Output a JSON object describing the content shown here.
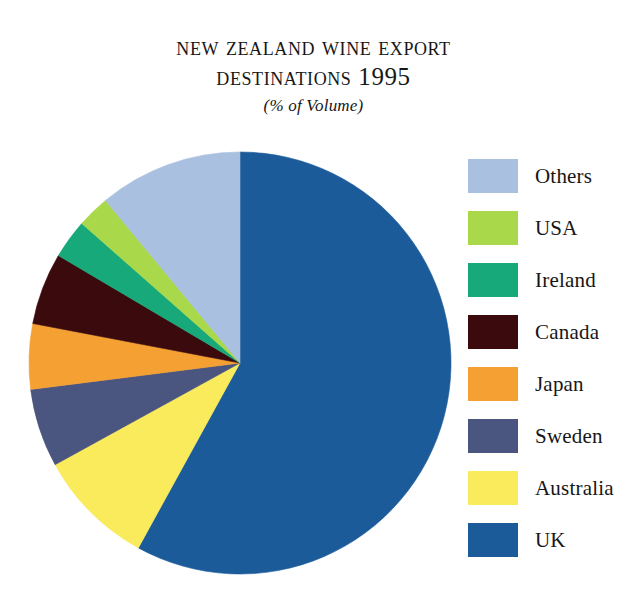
{
  "title": {
    "line1": "New Zealand Wine Export",
    "line2": "Destinations 1995",
    "subtitle": "(% of Volume)"
  },
  "legend": {
    "items": [
      {
        "label": "Others",
        "color": "#A9C0E0"
      },
      {
        "label": "USA",
        "color": "#A9D84A"
      },
      {
        "label": "Ireland",
        "color": "#18A97B"
      },
      {
        "label": "Canada",
        "color": "#3A0A0C"
      },
      {
        "label": "Japan",
        "color": "#F5A033"
      },
      {
        "label": "Sweden",
        "color": "#4A5680"
      },
      {
        "label": "Australia",
        "color": "#F9EB5C"
      },
      {
        "label": "UK",
        "color": "#1C5B9A"
      }
    ]
  },
  "chart_data": {
    "type": "pie",
    "title": "New Zealand Wine Export Destinations 1995",
    "subtitle": "(% of Volume)",
    "unit": "% of Volume",
    "legend_position": "right",
    "start_angle_deg": 0,
    "direction": "clockwise",
    "categories": [
      "UK",
      "Australia",
      "Sweden",
      "Japan",
      "Canada",
      "Ireland",
      "USA",
      "Others"
    ],
    "values": [
      58.0,
      9.0,
      6.0,
      5.0,
      5.5,
      3.0,
      2.5,
      11.0
    ],
    "colors": [
      "#1C5B9A",
      "#F9EB5C",
      "#4A5680",
      "#F5A033",
      "#3A0A0C",
      "#18A97B",
      "#A9D84A",
      "#A9C0E0"
    ],
    "slices": [
      {
        "label": "UK",
        "value": 58.0,
        "color": "#1C5B9A",
        "start_deg": 0.0,
        "end_deg": 208.8
      },
      {
        "label": "Australia",
        "value": 9.0,
        "color": "#F9EB5C",
        "start_deg": 208.8,
        "end_deg": 241.2
      },
      {
        "label": "Sweden",
        "value": 6.0,
        "color": "#4A5680",
        "start_deg": 241.2,
        "end_deg": 262.8
      },
      {
        "label": "Japan",
        "value": 5.0,
        "color": "#F5A033",
        "start_deg": 262.8,
        "end_deg": 280.8
      },
      {
        "label": "Canada",
        "value": 5.5,
        "color": "#3A0A0C",
        "start_deg": 280.8,
        "end_deg": 300.6
      },
      {
        "label": "Ireland",
        "value": 3.0,
        "color": "#18A97B",
        "start_deg": 300.6,
        "end_deg": 311.4
      },
      {
        "label": "USA",
        "value": 2.5,
        "color": "#A9D84A",
        "start_deg": 311.4,
        "end_deg": 320.4
      },
      {
        "label": "Others",
        "value": 11.0,
        "color": "#A9C0E0",
        "start_deg": 320.4,
        "end_deg": 360.0
      }
    ]
  }
}
